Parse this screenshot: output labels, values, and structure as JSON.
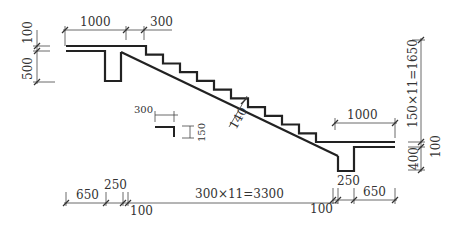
{
  "drawing": {
    "title": "Stair section dimension diagram",
    "stroke_color": "#222222",
    "dim_color": "#444444"
  },
  "dimensions": {
    "top_landing_width": "1000",
    "top_first_tread": "300",
    "left_slab_thickness": "100",
    "left_beam_depth": "500",
    "right_total_height": "150×11=1650",
    "right_landing_width": "1000",
    "right_slab_thickness": "100",
    "right_beam_depth": "400",
    "waist_thickness": "140",
    "detail_tread": "300",
    "detail_riser": "150",
    "bottom_left_landing": "650",
    "bottom_left_beam": "250",
    "bottom_left_offset": "100",
    "bottom_run": "300×11=3300",
    "bottom_right_offset": "100",
    "bottom_right_beam": "250",
    "bottom_right_landing": "650"
  }
}
